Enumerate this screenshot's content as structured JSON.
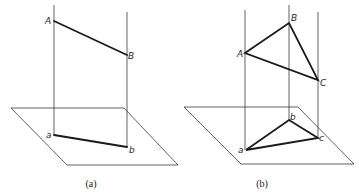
{
  "figures": [
    {
      "id": "a",
      "caption": "(a)",
      "space_points": [
        {
          "label": "A",
          "x": 54,
          "y": 21
        },
        {
          "label": "B",
          "x": 127,
          "y": 55
        }
      ],
      "projected_points": [
        {
          "label": "a",
          "x": 54,
          "y": 135
        },
        {
          "label": "b",
          "x": 127,
          "y": 147
        }
      ],
      "projectors": [
        {
          "x": 54,
          "y1": 5,
          "y2": 135
        },
        {
          "x": 127,
          "y1": 12,
          "y2": 147
        }
      ],
      "plane": [
        [
          11,
          108
        ],
        [
          124,
          108
        ],
        [
          178,
          165
        ],
        [
          67,
          165
        ]
      ],
      "caption_pos": [
        91,
        187
      ]
    },
    {
      "id": "b",
      "caption": "(b)",
      "space_points": [
        {
          "label": "A",
          "x": 245,
          "y": 53
        },
        {
          "label": "B",
          "x": 289,
          "y": 23
        },
        {
          "label": "C",
          "x": 318,
          "y": 80
        }
      ],
      "projected_points": [
        {
          "label": "a",
          "x": 246,
          "y": 150
        },
        {
          "label": "b",
          "x": 289,
          "y": 120
        },
        {
          "label": "c",
          "x": 318,
          "y": 138
        }
      ],
      "projectors": [
        {
          "x": 245,
          "y1": 10,
          "y2": 150
        },
        {
          "x": 289,
          "y1": 5,
          "y2": 120
        },
        {
          "x": 318,
          "y1": 12,
          "y2": 138
        }
      ],
      "plane": [
        [
          184,
          107
        ],
        [
          298,
          107
        ],
        [
          354,
          164
        ],
        [
          241,
          164
        ]
      ],
      "caption_pos": [
        262,
        187
      ]
    }
  ],
  "labels": {
    "a_A": "A",
    "a_B": "B",
    "a_a": "a",
    "a_b": "b",
    "b_A": "A",
    "b_B": "B",
    "b_C": "C",
    "b_a": "a",
    "b_b": "b",
    "b_c": "c",
    "caption_a": "(a)",
    "caption_b": "(b)"
  }
}
